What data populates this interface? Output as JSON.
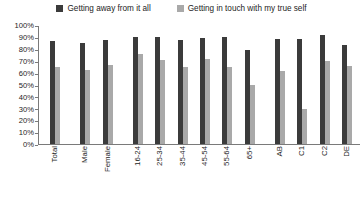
{
  "chart_data": {
    "type": "bar",
    "title": "",
    "xlabel": "",
    "ylabel": "",
    "ylim": [
      0,
      100
    ],
    "ytick_labels": [
      "100%",
      "90%",
      "80%",
      "70%",
      "60%",
      "50%",
      "40%",
      "30%",
      "20%",
      "10%",
      "0%"
    ],
    "ytick_values": [
      100,
      90,
      80,
      70,
      60,
      50,
      40,
      30,
      20,
      10,
      0
    ],
    "grid": false,
    "legend_position": "top",
    "categories": [
      "Total",
      "Male",
      "Female",
      "16-24",
      "25-34",
      "35-44",
      "45-54",
      "55-64",
      "65+",
      "AB",
      "C1",
      "C2",
      "DE"
    ],
    "group_breaks_after": [
      "Total",
      "Female",
      "65+"
    ],
    "series": [
      {
        "name": "Getting away from it all",
        "color": "#3b3b3b",
        "values": [
          87,
          86,
          88,
          91,
          91,
          88,
          90,
          91,
          80,
          89,
          89,
          92,
          84
        ]
      },
      {
        "name": "Getting in touch with my true self",
        "color": "#a9a9a9",
        "values": [
          65,
          63,
          67,
          76,
          71,
          65,
          72,
          65,
          50,
          62,
          30,
          70,
          66
        ]
      }
    ]
  }
}
